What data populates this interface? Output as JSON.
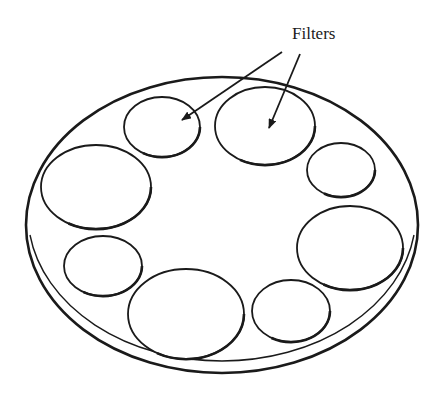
{
  "diagram": {
    "label": "Filters",
    "label_pos": {
      "x": 292,
      "y": 24
    },
    "stroke_color": "#1a1a1a",
    "background": "#ffffff",
    "plate": {
      "cx": 222,
      "cy": 225,
      "rx": 196,
      "ry": 148
    },
    "filters": [
      {
        "cx": 162,
        "cy": 127,
        "rx": 38,
        "ry": 30
      },
      {
        "cx": 265,
        "cy": 126,
        "rx": 50,
        "ry": 39
      },
      {
        "cx": 341,
        "cy": 170,
        "rx": 34,
        "ry": 27
      },
      {
        "cx": 96,
        "cy": 187,
        "rx": 55,
        "ry": 42
      },
      {
        "cx": 350,
        "cy": 248,
        "rx": 53,
        "ry": 42
      },
      {
        "cx": 103,
        "cy": 266,
        "rx": 39,
        "ry": 30
      },
      {
        "cx": 186,
        "cy": 314,
        "rx": 58,
        "ry": 45
      },
      {
        "cx": 291,
        "cy": 311,
        "rx": 39,
        "ry": 31
      }
    ],
    "arrows": [
      {
        "x1": 282,
        "y1": 52,
        "x2": 182,
        "y2": 120
      },
      {
        "x1": 300,
        "y1": 54,
        "x2": 269,
        "y2": 128
      }
    ]
  }
}
